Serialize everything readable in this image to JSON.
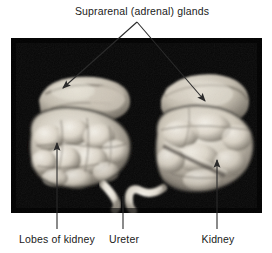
{
  "figure": {
    "background_color": "#ffffff",
    "photo": {
      "x": 11,
      "y": 38,
      "width": 251,
      "height": 175,
      "background_color": "#060606",
      "description": "Black-background photograph of two lobulated kidney specimens side by side, each capped by a suprarenal gland, with pale ureters emerging toward the center bottom",
      "specimens": [
        {
          "name": "left-kidney-specimen",
          "tissue_color": "#d8d2c6",
          "shadow_color": "#5d5850"
        },
        {
          "name": "right-kidney-specimen",
          "tissue_color": "#d8d2c6",
          "shadow_color": "#5d5850"
        }
      ]
    },
    "line_color": "#2b2b2b",
    "text_color": "#1a1a1a"
  },
  "labels": {
    "title": "Suprarenal (adrenal) glands",
    "lobes": "Lobes of kidney",
    "ureter": "Ureter",
    "kidney": "Kidney"
  },
  "callouts": [
    {
      "name": "suprarenal-glands-callout",
      "label": "Suprarenal (adrenal) glands",
      "style": "branched-double-arrow",
      "apex": {
        "x": 137,
        "y": 22
      },
      "targets": [
        {
          "x": 63,
          "y": 88,
          "side": "left"
        },
        {
          "x": 205,
          "y": 101,
          "side": "right"
        }
      ]
    },
    {
      "name": "lobes-of-kidney-callout",
      "label": "Lobes of kidney",
      "style": "vertical-arrow-up",
      "target": {
        "x": 57,
        "y": 143
      },
      "line_bottom": {
        "x": 57,
        "y": 229
      }
    },
    {
      "name": "ureter-callout",
      "label": "Ureter",
      "style": "vertical-line",
      "target": {
        "x": 123,
        "y": 196
      },
      "line_bottom": {
        "x": 123,
        "y": 229
      }
    },
    {
      "name": "kidney-callout",
      "label": "Kidney",
      "style": "vertical-arrow-up",
      "target": {
        "x": 217,
        "y": 160
      },
      "line_bottom": {
        "x": 217,
        "y": 229
      }
    }
  ]
}
